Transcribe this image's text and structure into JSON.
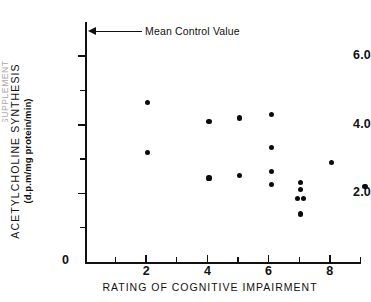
{
  "figure": {
    "edge_clip_label": "SUPPLEMENT",
    "annotation": {
      "text": "Mean Control Value",
      "icon": "left-arrow-icon"
    }
  },
  "chart_data": {
    "type": "scatter",
    "title": "",
    "xlabel": "RATING OF COGNITIVE IMPAIRMENT",
    "ylabel": "ACETYLCHOLINE  SYNTHESIS",
    "ylabel_units": "(d.p.m/mg protein/min)",
    "xlim": [
      0,
      9.5
    ],
    "ylim": [
      0,
      6.9
    ],
    "grid": false,
    "legend": null,
    "xticks": [
      0,
      2,
      4,
      6,
      8
    ],
    "xtick_labels": [
      "0",
      "2",
      "4",
      "6",
      "8"
    ],
    "xminor_ticks": [
      1,
      3,
      5,
      7,
      9
    ],
    "yticks": [
      2.0,
      4.0,
      6.0
    ],
    "ytick_labels": [
      "2.0",
      "4.0",
      "6.0"
    ],
    "yminor_ticks": [
      1.0,
      3.0,
      5.0
    ],
    "marker": "filled-circle",
    "marker_color": "#0b0b0b",
    "points": [
      {
        "x": 2.05,
        "y": 4.65
      },
      {
        "x": 2.05,
        "y": 3.2
      },
      {
        "x": 4.05,
        "y": 4.1
      },
      {
        "x": 4.05,
        "y": 2.45
      },
      {
        "x": 5.05,
        "y": 4.2
      },
      {
        "x": 5.05,
        "y": 2.52
      },
      {
        "x": 6.1,
        "y": 4.3
      },
      {
        "x": 6.1,
        "y": 3.35
      },
      {
        "x": 6.1,
        "y": 2.65
      },
      {
        "x": 6.1,
        "y": 2.25
      },
      {
        "x": 7.05,
        "y": 2.32
      },
      {
        "x": 7.05,
        "y": 2.12
      },
      {
        "x": 6.95,
        "y": 1.85
      },
      {
        "x": 7.15,
        "y": 1.84
      },
      {
        "x": 7.05,
        "y": 1.4
      },
      {
        "x": 8.05,
        "y": 2.9
      },
      {
        "x": 9.15,
        "y": 2.2
      }
    ],
    "annotations": [
      {
        "text": "Mean Control Value",
        "y": 6.55,
        "type": "arrow-to-y-axis"
      }
    ]
  }
}
